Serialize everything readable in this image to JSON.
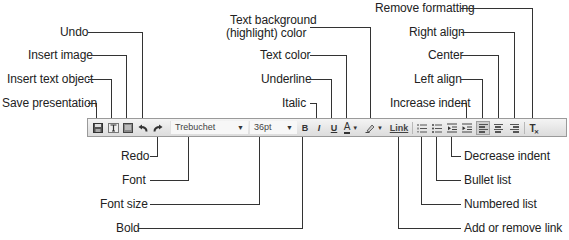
{
  "diagram": {
    "type": "toolbar-callout",
    "toolbar": {
      "font_select": {
        "value": "Trebuchet"
      },
      "size_select": {
        "value": "36pt"
      },
      "bold_glyph": "B",
      "italic_glyph": "I",
      "underline_glyph": "U",
      "text_color_glyph": "A",
      "link_label": "Link",
      "remove_format_glyph": "T"
    },
    "callouts_top": [
      {
        "id": "undo",
        "label": "Undo"
      },
      {
        "id": "insert-image",
        "label": "Insert image"
      },
      {
        "id": "insert-text-object",
        "label": "Insert text object"
      },
      {
        "id": "save-presentation",
        "label": "Save presentation"
      },
      {
        "id": "text-background",
        "label_line1": "Text background",
        "label_line2": "(highlight) color"
      },
      {
        "id": "text-color",
        "label": "Text color"
      },
      {
        "id": "underline",
        "label": "Underline"
      },
      {
        "id": "italic",
        "label": "Italic"
      },
      {
        "id": "remove-formatting",
        "label": "Remove formatting"
      },
      {
        "id": "right-align",
        "label": "Right align"
      },
      {
        "id": "center",
        "label": "Center"
      },
      {
        "id": "left-align",
        "label": "Left align"
      },
      {
        "id": "increase-indent",
        "label": "Increase indent"
      }
    ],
    "callouts_bottom": [
      {
        "id": "redo",
        "label": "Redo"
      },
      {
        "id": "font",
        "label": "Font"
      },
      {
        "id": "font-size",
        "label": "Font size"
      },
      {
        "id": "bold",
        "label": "Bold"
      },
      {
        "id": "decrease-indent",
        "label": "Decrease indent"
      },
      {
        "id": "bullet-list",
        "label": "Bullet list"
      },
      {
        "id": "numbered-list",
        "label": "Numbered list"
      },
      {
        "id": "add-remove-link",
        "label": "Add or remove link"
      }
    ]
  }
}
